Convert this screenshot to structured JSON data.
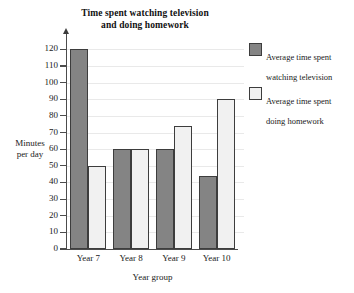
{
  "chart_data": {
    "type": "bar",
    "title": "Time spent watching television\nand doing homework",
    "title_line1": "Time spent watching television",
    "title_line2": "and doing homework",
    "xlabel": "Year group",
    "ylabel": "Minutes\nper day",
    "ylabel_line1": "Minutes",
    "ylabel_line2": "per day",
    "categories": [
      "Year 7",
      "Year 8",
      "Year 9",
      "Year 10"
    ],
    "series": [
      {
        "name": "Average time spent watching television",
        "name_line1": "Average time spent",
        "name_line2": "watching television",
        "key": "tv",
        "color": "#848484",
        "values": [
          120,
          60,
          60,
          44
        ]
      },
      {
        "name": "Average time spent doing homework",
        "name_line1": "Average time spent",
        "name_line2": "doing homework",
        "key": "hw",
        "color": "#f1f1f1",
        "values": [
          50,
          60,
          74,
          90
        ]
      }
    ],
    "ylim": [
      0,
      125
    ],
    "yticks": [
      0,
      10,
      20,
      30,
      40,
      50,
      60,
      70,
      80,
      90,
      100,
      110,
      120
    ],
    "ytick_labels": [
      "0",
      "10",
      "20",
      "30",
      "40",
      "50",
      "60",
      "70",
      "80",
      "90",
      "100",
      "110",
      "120"
    ],
    "grid": true,
    "grid_axis": "y",
    "legend_position": "right",
    "bar_border_color": "#3d3d3d",
    "axis_color": "#4c4c4c",
    "gridline_color": "#e9e9e9",
    "background": "#ffffff"
  }
}
